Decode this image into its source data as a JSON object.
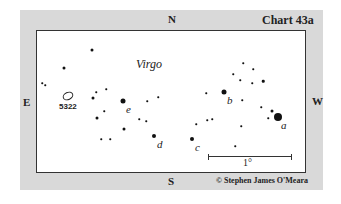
{
  "title": "Chart 43a",
  "constellation": "Virgo",
  "compass": {
    "north": "N",
    "south": "S",
    "east": "E",
    "west": "W"
  },
  "scale_label": "1°",
  "copyright": "© Stephen James O'Meara",
  "galaxy": {
    "label": "5322",
    "x": 68,
    "y": 96
  },
  "labeled_stars": [
    {
      "id": "a",
      "x": 278,
      "y": 117,
      "size": 8
    },
    {
      "id": "b",
      "x": 224,
      "y": 92,
      "size": 5
    },
    {
      "id": "c",
      "x": 192,
      "y": 139,
      "size": 4
    },
    {
      "id": "d",
      "x": 154,
      "y": 136,
      "size": 4
    },
    {
      "id": "e",
      "x": 123,
      "y": 101,
      "size": 5
    }
  ],
  "stars": [
    {
      "x": 92,
      "y": 50,
      "s": 3
    },
    {
      "x": 64,
      "y": 68,
      "s": 3
    },
    {
      "x": 42,
      "y": 83,
      "s": 1.5
    },
    {
      "x": 45,
      "y": 85,
      "s": 1.5
    },
    {
      "x": 96,
      "y": 92,
      "s": 1.5
    },
    {
      "x": 106,
      "y": 89,
      "s": 1.5
    },
    {
      "x": 93,
      "y": 98,
      "s": 3
    },
    {
      "x": 104,
      "y": 111,
      "s": 1.5
    },
    {
      "x": 97,
      "y": 118,
      "s": 3
    },
    {
      "x": 101,
      "y": 139,
      "s": 1.5
    },
    {
      "x": 110,
      "y": 139,
      "s": 1.5
    },
    {
      "x": 124,
      "y": 129,
      "s": 3
    },
    {
      "x": 139,
      "y": 119,
      "s": 1.5
    },
    {
      "x": 147,
      "y": 101,
      "s": 1.5
    },
    {
      "x": 146,
      "y": 121,
      "s": 1.5
    },
    {
      "x": 158,
      "y": 97,
      "s": 1.5
    },
    {
      "x": 243,
      "y": 63,
      "s": 1.5
    },
    {
      "x": 253,
      "y": 69,
      "s": 1.5
    },
    {
      "x": 233,
      "y": 74,
      "s": 1.5
    },
    {
      "x": 240,
      "y": 80,
      "s": 1.5
    },
    {
      "x": 263,
      "y": 81,
      "s": 2.5
    },
    {
      "x": 252,
      "y": 83,
      "s": 1.5
    },
    {
      "x": 206,
      "y": 93,
      "s": 1.5
    },
    {
      "x": 242,
      "y": 100,
      "s": 1.5
    },
    {
      "x": 272,
      "y": 111,
      "s": 3
    },
    {
      "x": 268,
      "y": 118,
      "s": 1.5
    },
    {
      "x": 261,
      "y": 107,
      "s": 1.5
    },
    {
      "x": 196,
      "y": 124,
      "s": 1.5
    },
    {
      "x": 207,
      "y": 120,
      "s": 1.5
    },
    {
      "x": 212,
      "y": 119,
      "s": 1.5
    },
    {
      "x": 241,
      "y": 126,
      "s": 1.5
    },
    {
      "x": 235,
      "y": 146,
      "s": 1.5
    }
  ]
}
